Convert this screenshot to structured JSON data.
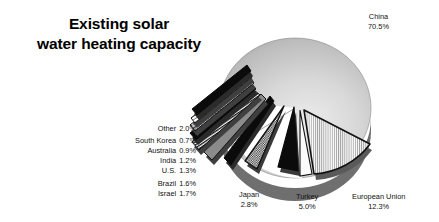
{
  "title": {
    "line1": "Existing solar",
    "line2": "water heating capacity"
  },
  "callouts": {
    "china": {
      "name": "China",
      "pct": "70.5%"
    },
    "eu": {
      "name": "European Union",
      "pct": "12.3%"
    },
    "turkey": {
      "name": "Turkey",
      "pct": "5.0%"
    },
    "japan": {
      "name": "Japan",
      "pct": "2.8%"
    }
  },
  "legend": [
    {
      "name": "Other",
      "pct": "2.0%"
    },
    {
      "name": "South Korea",
      "pct": "0.7%"
    },
    {
      "name": "Australia",
      "pct": "0.9%"
    },
    {
      "name": "India",
      "pct": "1.2%"
    },
    {
      "name": "U.S.",
      "pct": "1.3%"
    },
    {
      "name": "Brazil",
      "pct": "1.6%"
    },
    {
      "name": "Israel",
      "pct": "1.7%"
    }
  ],
  "colors": {
    "background": "#ffffff",
    "text": "#111111",
    "title": "#000000",
    "pie_light": "#e3e3e3",
    "pie_mid": "#bdbdbd",
    "pie_dark": "#8f8f8f",
    "slice_black": "#0b0b0b",
    "slice_white": "#fcfcfc",
    "hatch_line": "#9a9a9a",
    "outline": "#111111"
  },
  "chart_data": {
    "type": "pie",
    "title": "Existing solar water heating capacity",
    "unit": "percent",
    "legend_position": "left-and-callouts",
    "grid": false,
    "categories": [
      "China",
      "European Union",
      "Turkey",
      "Japan",
      "Other",
      "Israel",
      "Brazil",
      "U.S.",
      "India",
      "Australia",
      "South Korea"
    ],
    "values": [
      70.5,
      12.3,
      5.0,
      2.8,
      2.0,
      1.7,
      1.6,
      1.3,
      1.2,
      0.9,
      0.7
    ],
    "exploded": [
      "European Union",
      "Turkey",
      "Japan",
      "Other",
      "Israel",
      "Brazil",
      "U.S.",
      "India",
      "Australia",
      "South Korea"
    ],
    "slice_fills": {
      "China": "gray-gradient",
      "European Union": "vertical-hatch",
      "Turkey": "solid-black",
      "Japan": "checker",
      "Israel": "solid-black",
      "Brazil": "gray",
      "U.S.": "horizontal-stripe",
      "India": "solid-black",
      "Australia": "dotted",
      "South Korea": "light-stripe",
      "Other": "solid-black"
    }
  }
}
